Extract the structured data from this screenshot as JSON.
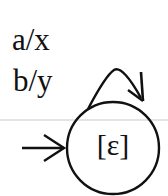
{
  "diagram": {
    "type": "finite-state-transducer",
    "states": [
      {
        "id": "s0",
        "label": "[ε]",
        "initial": true
      }
    ],
    "transitions": [
      {
        "from": "s0",
        "to": "s0",
        "labels": [
          "a/x",
          "b/y"
        ]
      }
    ],
    "loop_labels": {
      "first": "a/x",
      "second": "b/y"
    },
    "state_label": "[ε]",
    "colors": {
      "stroke": "#111111",
      "background": "#ffffff",
      "scanline": "#d8d8d8"
    }
  }
}
